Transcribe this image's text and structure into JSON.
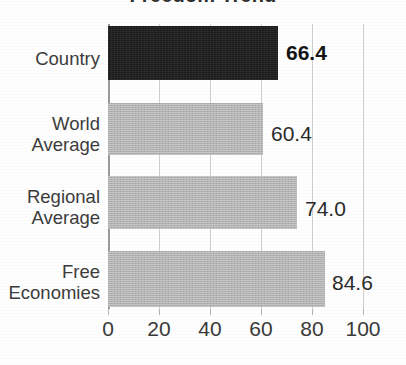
{
  "chart_data": {
    "type": "bar",
    "orientation": "horizontal",
    "title": "Freedom Trend",
    "categories": [
      "Country",
      "World\nAverage",
      "Regional\nAverage",
      "Free\nEconomies"
    ],
    "values": [
      66.4,
      60.4,
      74.0,
      84.6
    ],
    "value_labels": [
      "66.4",
      "60.4",
      "74.0",
      "84.6"
    ],
    "highlight_index": 0,
    "xlabel": "",
    "ylabel": "",
    "xlim": [
      0,
      100
    ],
    "xticks": [
      0,
      20,
      40,
      60,
      80,
      100
    ],
    "xtick_labels": [
      "0",
      "20",
      "40",
      "60",
      "80",
      "100"
    ],
    "grid": true,
    "legend": false,
    "colors": {
      "highlight_bar": "#1b1b1b",
      "bar": "#b2b2b2",
      "gridline": "#cfcfcf",
      "axis": "#9a9a9a",
      "text": "#3a3a3a",
      "background": "#fefefe"
    }
  },
  "bars": [
    {
      "label_line1": "Country",
      "label_line2": "",
      "value": "66.4",
      "bold": true
    },
    {
      "label_line1": "World",
      "label_line2": "Average",
      "value": "60.4",
      "bold": false
    },
    {
      "label_line1": "Regional",
      "label_line2": "Average",
      "value": "74.0",
      "bold": false
    },
    {
      "label_line1": "Free",
      "label_line2": "Economies",
      "value": "84.6",
      "bold": false
    }
  ],
  "axis": {
    "ticks": [
      "0",
      "20",
      "40",
      "60",
      "80",
      "100"
    ]
  }
}
